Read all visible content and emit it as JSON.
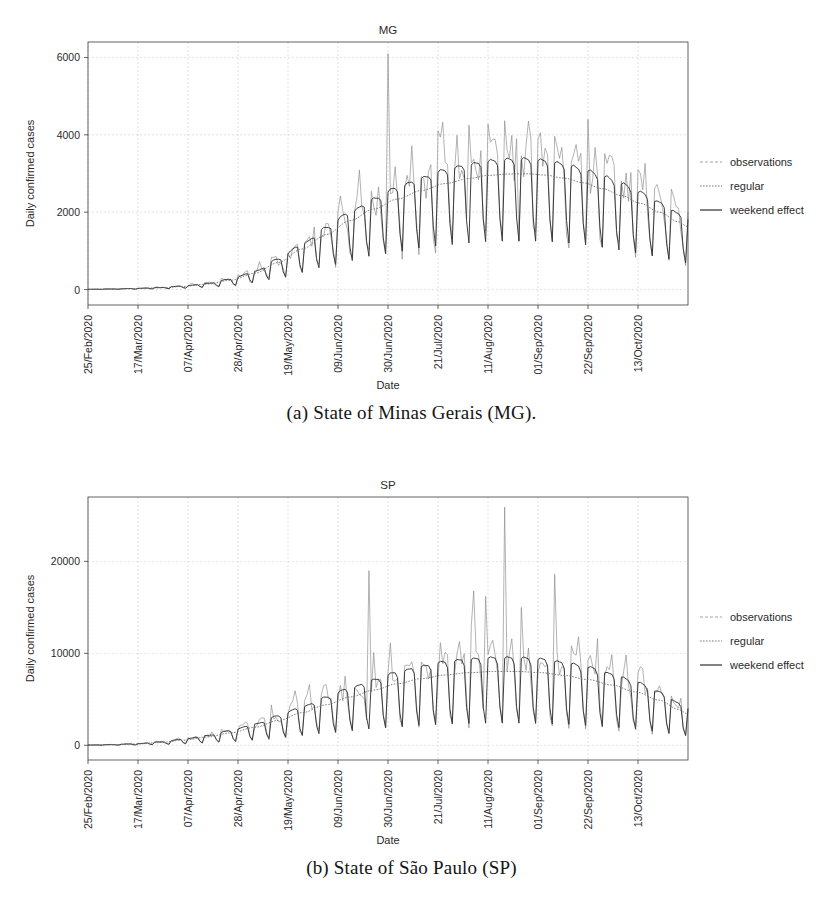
{
  "figure": {
    "subfigures": [
      {
        "caption": "(a) State of Minas Gerais (MG).",
        "chart_key": "mg"
      },
      {
        "caption": "(b) State of São Paulo (SP)",
        "chart_key": "sp"
      }
    ]
  },
  "legend": {
    "position": "right",
    "items": [
      {
        "label": "observations",
        "style": "dashed-light",
        "color": "#9a9a9a"
      },
      {
        "label": "regular",
        "style": "dotted",
        "color": "#7a7a84"
      },
      {
        "label": "weekend effect",
        "style": "solid",
        "color": "#2f2f2f"
      }
    ]
  },
  "chart_data": [
    {
      "id": "mg",
      "type": "line",
      "title": "MG",
      "xlabel": "Date",
      "ylabel": "Daily confirmed cases",
      "ylim": [
        -400,
        6400
      ],
      "yticks": [
        0,
        2000,
        4000,
        6000
      ],
      "ytick_labels": [
        "0",
        "2000",
        "4000",
        "6000"
      ],
      "xlim": [
        0,
        252
      ],
      "xticks": [
        0,
        21,
        42,
        63,
        84,
        105,
        126,
        147,
        168,
        189,
        210,
        231
      ],
      "xtick_labels": [
        "25/Feb/2020",
        "17/Mar/2020",
        "07/Apr/2020",
        "28/Apr/2020",
        "19/May/2020",
        "09/Jun/2020",
        "30/Jun/2020",
        "21/Jul/2020",
        "11/Aug/2020",
        "01/Sep/2020",
        "22/Sep/2020",
        "13/Oct/2020"
      ],
      "grid": true,
      "series": [
        {
          "name": "regular",
          "description": "smooth trend curve, daily values",
          "comment": "logistic-like rise peaking near 11/Aug/2020 at ~3000 then slow decline",
          "anchors": [
            [
              0,
              5
            ],
            [
              10,
              12
            ],
            [
              20,
              25
            ],
            [
              30,
              45
            ],
            [
              40,
              80
            ],
            [
              50,
              140
            ],
            [
              60,
              240
            ],
            [
              70,
              420
            ],
            [
              80,
              700
            ],
            [
              90,
              1050
            ],
            [
              100,
              1420
            ],
            [
              110,
              1780
            ],
            [
              120,
              2080
            ],
            [
              130,
              2340
            ],
            [
              140,
              2560
            ],
            [
              150,
              2740
            ],
            [
              160,
              2870
            ],
            [
              168,
              2950
            ],
            [
              176,
              2985
            ],
            [
              184,
              2995
            ],
            [
              192,
              2960
            ],
            [
              200,
              2880
            ],
            [
              208,
              2760
            ],
            [
              216,
              2610
            ],
            [
              224,
              2430
            ],
            [
              232,
              2230
            ],
            [
              240,
              2000
            ],
            [
              248,
              1750
            ],
            [
              252,
              1620
            ]
          ]
        },
        {
          "name": "weekend effect",
          "description": "trend plus weekly (weekday-high / weekend-low) sawtooth",
          "weekly_pattern_multiplier": [
            1.12,
            1.14,
            1.13,
            1.12,
            1.08,
            0.62,
            0.42
          ],
          "comment": "weekday plateau ~3200 at peak, weekend troughs dropping to ~1100"
        },
        {
          "name": "observations",
          "description": "noisy daily reported counts around the weekend-effect curve",
          "noise_scale": 0.22,
          "max_spike": {
            "x": 126,
            "value": 6100,
            "label": "single-day reporting spike near 30/Jun/2020"
          },
          "notable_peaks": [
            [
              147,
              4100
            ],
            [
              160,
              4250
            ],
            [
              168,
              4280
            ],
            [
              180,
              3900
            ],
            [
              196,
              3960
            ],
            [
              210,
              4400
            ],
            [
              232,
              3000
            ]
          ],
          "comment": "observed peaks reach ~4000-4400 in Jul-Sep; end of series ~1500-2000"
        }
      ]
    },
    {
      "id": "sp",
      "type": "line",
      "title": "SP",
      "xlabel": "Date",
      "ylabel": "Daily confirmed cases",
      "ylim": [
        -1600,
        27000
      ],
      "yticks": [
        0,
        10000,
        20000
      ],
      "ytick_labels": [
        "0",
        "10000",
        "20000"
      ],
      "xlim": [
        0,
        252
      ],
      "xticks": [
        0,
        21,
        42,
        63,
        84,
        105,
        126,
        147,
        168,
        189,
        210,
        231
      ],
      "xtick_labels": [
        "25/Feb/2020",
        "17/Mar/2020",
        "07/Apr/2020",
        "28/Apr/2020",
        "19/May/2020",
        "09/Jun/2020",
        "30/Jun/2020",
        "21/Jul/2020",
        "11/Aug/2020",
        "01/Sep/2020",
        "22/Sep/2020",
        "13/Oct/2020"
      ],
      "grid": true,
      "series": [
        {
          "name": "regular",
          "description": "smooth trend curve, daily values",
          "comment": "rises to ~8000 plateau near 11/Aug/2020, then gradual decline to ~3000",
          "anchors": [
            [
              0,
              20
            ],
            [
              10,
              60
            ],
            [
              20,
              140
            ],
            [
              30,
              300
            ],
            [
              40,
              560
            ],
            [
              50,
              900
            ],
            [
              60,
              1350
            ],
            [
              70,
              1950
            ],
            [
              80,
              2700
            ],
            [
              90,
              3550
            ],
            [
              100,
              4400
            ],
            [
              110,
              5250
            ],
            [
              120,
              6000
            ],
            [
              130,
              6700
            ],
            [
              140,
              7250
            ],
            [
              150,
              7650
            ],
            [
              160,
              7900
            ],
            [
              170,
              8020
            ],
            [
              180,
              8030
            ],
            [
              190,
              7900
            ],
            [
              200,
              7600
            ],
            [
              210,
              7150
            ],
            [
              220,
              6550
            ],
            [
              230,
              5800
            ],
            [
              240,
              4900
            ],
            [
              248,
              3900
            ],
            [
              252,
              3400
            ]
          ]
        },
        {
          "name": "weekend effect",
          "description": "trend plus weekly (weekday-high / weekend-low) sawtooth",
          "weekly_pattern_multiplier": [
            1.18,
            1.2,
            1.19,
            1.18,
            1.1,
            0.52,
            0.3
          ],
          "comment": "weekday plateau ~9600 at peak, deep weekend troughs near 2000"
        },
        {
          "name": "observations",
          "description": "noisy daily reported counts with large reporting spikes",
          "noise_scale": 0.25,
          "max_spike": {
            "x": 175,
            "value": 25900,
            "label": "largest reporting spike near 11/Aug/2020"
          },
          "notable_peaks": [
            [
              118,
              19000
            ],
            [
              162,
              16800
            ],
            [
              167,
              16200
            ],
            [
              182,
              15000
            ],
            [
              196,
              18600
            ],
            [
              206,
              11800
            ],
            [
              214,
              11600
            ]
          ],
          "comment": "earlier spike ~19000 near 09/Jun/2020; series ends ~4000-6000"
        }
      ]
    }
  ]
}
